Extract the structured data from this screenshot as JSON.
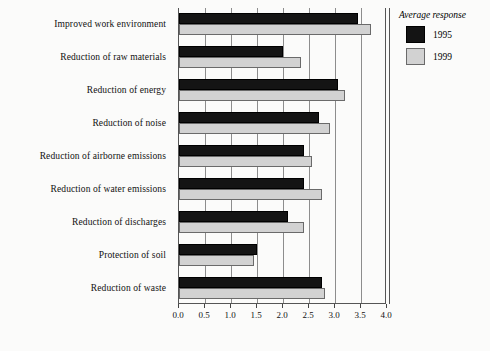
{
  "chart_data": {
    "type": "bar",
    "orientation": "horizontal",
    "title": "",
    "subtitle": "",
    "xlabel": "",
    "ylabel": "",
    "xlim": [
      0.0,
      4.0
    ],
    "xticks": [
      "0.0",
      "0.5",
      "1.0",
      "1.5",
      "2.0",
      "2.5",
      "3.0",
      "3.5",
      "4.0"
    ],
    "xtick_values": [
      0.0,
      0.5,
      1.0,
      1.5,
      2.0,
      2.5,
      3.0,
      3.5,
      4.0
    ],
    "grid": true,
    "grid_axis": "x",
    "legend_position": "right-top",
    "categories": [
      "Improved work environment",
      "Reduction of raw materials",
      "Reduction of energy",
      "Reduction of noise",
      "Reduction of airborne emissions",
      "Reduction of water emissions",
      "Reduction of discharges",
      "Protection of soil",
      "Reduction of waste"
    ],
    "series": [
      {
        "name": "1995",
        "color": "#141414",
        "values": [
          3.45,
          2.0,
          3.05,
          2.7,
          2.4,
          2.4,
          2.1,
          1.5,
          2.75
        ]
      },
      {
        "name": "1999",
        "color": "#d2d2d2",
        "values": [
          3.7,
          2.35,
          3.2,
          2.9,
          2.55,
          2.75,
          2.4,
          1.45,
          2.8
        ]
      }
    ]
  },
  "legend": {
    "title": "Average response",
    "entries": [
      {
        "label": "1995",
        "color": "#141414"
      },
      {
        "label": "1999",
        "color": "#d2d2d2"
      }
    ]
  },
  "axis": {
    "x_tick_labels": [
      "0.0",
      "0.5",
      "1.0",
      "1.5",
      "2.0",
      "2.5",
      "3.0",
      "3.5",
      "4.0"
    ]
  }
}
